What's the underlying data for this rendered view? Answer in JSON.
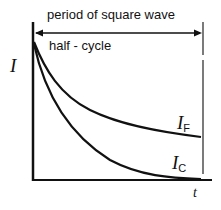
{
  "diagram": {
    "period_label": "period of square wave",
    "half_cycle_label": "half - cycle",
    "y_axis_label": "I",
    "x_axis_label": "t",
    "curve_faradaic": {
      "symbol": "I",
      "subscript": "F"
    },
    "curve_capacitive": {
      "symbol": "I",
      "subscript": "C"
    },
    "line_color": "#111111"
  }
}
